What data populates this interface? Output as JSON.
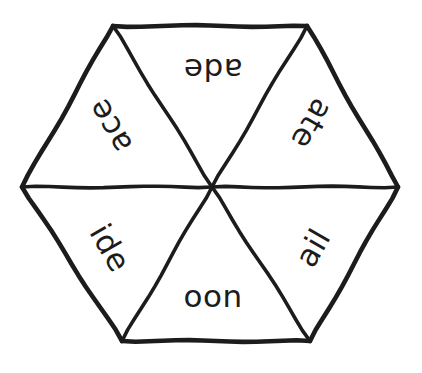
{
  "figure": {
    "kind": "hexagon-word-wheel",
    "background_color": "#ffffff",
    "stroke_color": "#1c1c1c",
    "stroke_width": 4,
    "center": {
      "x": 212,
      "y": 187
    },
    "vertices": [
      {
        "x": 113,
        "y": 26
      },
      {
        "x": 307,
        "y": 26
      },
      {
        "x": 398,
        "y": 187
      },
      {
        "x": 310,
        "y": 341
      },
      {
        "x": 122,
        "y": 341
      },
      {
        "x": 22,
        "y": 187
      }
    ],
    "spokes": [
      {
        "from": {
          "x": 212,
          "y": 187
        },
        "to": {
          "x": 113,
          "y": 26
        }
      },
      {
        "from": {
          "x": 212,
          "y": 187
        },
        "to": {
          "x": 307,
          "y": 26
        }
      },
      {
        "from": {
          "x": 212,
          "y": 187
        },
        "to": {
          "x": 398,
          "y": 187
        }
      },
      {
        "from": {
          "x": 212,
          "y": 187
        },
        "to": {
          "x": 310,
          "y": 341
        }
      },
      {
        "from": {
          "x": 212,
          "y": 187
        },
        "to": {
          "x": 122,
          "y": 341
        }
      },
      {
        "from": {
          "x": 212,
          "y": 187
        },
        "to": {
          "x": 22,
          "y": 187
        }
      }
    ]
  },
  "segments": [
    {
      "id": "top",
      "text": "ade",
      "position": "top",
      "x": 213,
      "y": 69,
      "rotation": 180,
      "font_size": 31
    },
    {
      "id": "upper-right",
      "text": "ate",
      "position": "upper-right",
      "x": 312,
      "y": 124,
      "rotation": 120,
      "font_size": 31
    },
    {
      "id": "lower-right",
      "text": "ail",
      "position": "lower-right",
      "x": 313,
      "y": 248,
      "rotation": -60,
      "font_size": 31
    },
    {
      "id": "bottom",
      "text": "oon",
      "position": "bottom",
      "x": 213,
      "y": 296,
      "rotation": 0,
      "font_size": 31
    },
    {
      "id": "lower-left",
      "text": "ide",
      "position": "lower-left",
      "x": 110,
      "y": 248,
      "rotation": 60,
      "font_size": 31
    },
    {
      "id": "upper-left",
      "text": "ace",
      "position": "upper-left",
      "x": 110,
      "y": 126,
      "rotation": -120,
      "font_size": 31
    }
  ]
}
